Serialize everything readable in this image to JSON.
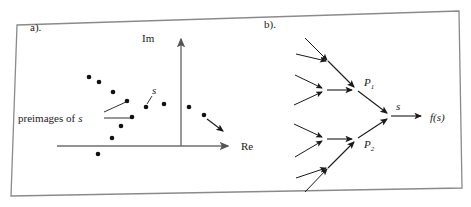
{
  "figure": {
    "border_color": "#8a8a8a",
    "ink_color": "#1a1a1a",
    "background": "#ffffff",
    "width": 471,
    "height": 207
  },
  "panel_a": {
    "label": "a).",
    "axis_im_label": "Im",
    "axis_re_label": "Re",
    "point_label": "s",
    "annotation": "preimages of",
    "annotation_var": "s",
    "origin": {
      "x": 181,
      "y": 146
    },
    "preimage_points": [
      {
        "x": 89,
        "y": 77
      },
      {
        "x": 99,
        "y": 82
      },
      {
        "x": 113,
        "y": 92
      },
      {
        "x": 127,
        "y": 101
      },
      {
        "x": 132,
        "y": 117
      },
      {
        "x": 121,
        "y": 126
      },
      {
        "x": 112,
        "y": 138
      },
      {
        "x": 98,
        "y": 154
      }
    ],
    "image_points": [
      {
        "x": 146,
        "y": 107
      },
      {
        "x": 164,
        "y": 104
      },
      {
        "x": 189,
        "y": 107
      },
      {
        "x": 204,
        "y": 115
      }
    ],
    "flow_arrow": {
      "x1": 207,
      "y1": 119,
      "x2": 224,
      "y2": 132
    },
    "s_leader": {
      "x1": 152,
      "y1": 95,
      "x2": 147,
      "y2": 104
    },
    "preimage_leaders": [
      {
        "x1": 104,
        "y1": 112,
        "x2": 126,
        "y2": 102
      },
      {
        "x1": 104,
        "y1": 118,
        "x2": 131,
        "y2": 118
      }
    ]
  },
  "panel_b": {
    "label": "b).",
    "node_1_label": "P",
    "node_1_sub": "1",
    "node_2_label": "P",
    "node_2_sub": "2",
    "edge_label": "s",
    "output_label": "f(s)",
    "root": {
      "x": 389,
      "y": 116
    },
    "nodes": [
      {
        "name": "P1",
        "x": 357,
        "y": 90
      },
      {
        "name": "P2",
        "x": 357,
        "y": 139
      }
    ],
    "output_arrow": {
      "x1": 392,
      "y1": 116,
      "x2": 422,
      "y2": 116
    },
    "branch_arrows": [
      {
        "x1": 357,
        "y1": 90,
        "x2": 387,
        "y2": 114
      },
      {
        "x1": 357,
        "y1": 139,
        "x2": 387,
        "y2": 119
      },
      {
        "x1": 330,
        "y1": 63,
        "x2": 355,
        "y2": 88
      },
      {
        "x1": 326,
        "y1": 90,
        "x2": 353,
        "y2": 90
      },
      {
        "x1": 326,
        "y1": 139,
        "x2": 353,
        "y2": 139
      },
      {
        "x1": 330,
        "y1": 166,
        "x2": 355,
        "y2": 141
      }
    ],
    "leaf_arrows": [
      {
        "x1": 305,
        "y1": 38,
        "x2": 328,
        "y2": 61
      },
      {
        "x1": 296,
        "y1": 54,
        "x2": 328,
        "y2": 61
      },
      {
        "x1": 295,
        "y1": 75,
        "x2": 324,
        "y2": 89
      },
      {
        "x1": 294,
        "y1": 105,
        "x2": 324,
        "y2": 91
      },
      {
        "x1": 294,
        "y1": 124,
        "x2": 324,
        "y2": 138
      },
      {
        "x1": 295,
        "y1": 157,
        "x2": 324,
        "y2": 140
      },
      {
        "x1": 296,
        "y1": 178,
        "x2": 328,
        "y2": 168
      },
      {
        "x1": 305,
        "y1": 192,
        "x2": 328,
        "y2": 168
      }
    ]
  }
}
